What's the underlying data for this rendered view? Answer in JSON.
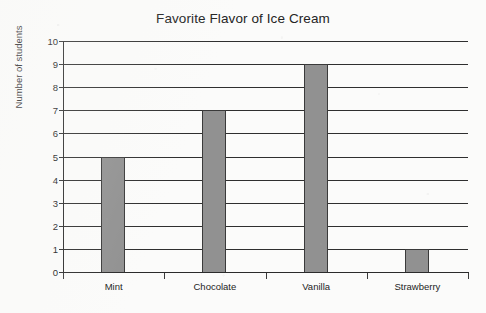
{
  "chart_data": {
    "type": "bar",
    "title": "Favorite Flavor of Ice Cream",
    "xlabel": "",
    "ylabel": "Number of students",
    "categories": [
      "Mint",
      "Chocolate",
      "Vanilla",
      "Strawberry"
    ],
    "values": [
      5,
      7,
      9,
      1
    ],
    "ylim": [
      0,
      10
    ],
    "ytick_step": 1,
    "ytick_labels": [
      "10",
      "9",
      "8",
      "7",
      "6",
      "5",
      "4",
      "3",
      "2",
      "1",
      "0"
    ],
    "grid": true,
    "grid_orientation": "horizontal",
    "legend": null,
    "legend_position": "none",
    "bar_color": "#919191",
    "bar_edge_color": "#3a3a3a",
    "axis_color": "#2b2b2b",
    "text_color": "#1d1d1d",
    "background_color": "#fbfbfa"
  }
}
